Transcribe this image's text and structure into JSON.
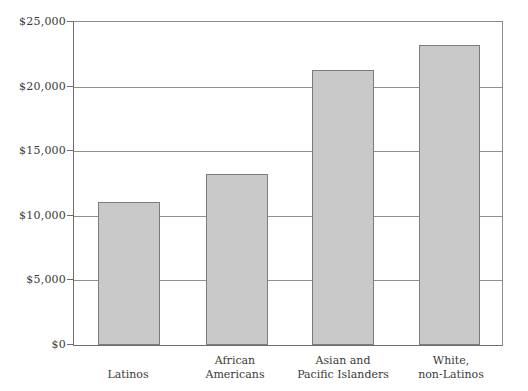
{
  "chart_data": {
    "type": "bar",
    "title": "",
    "subtitle": "",
    "xlabel": "",
    "ylabel": "",
    "categories": [
      "Latinos",
      "African Americans",
      "Asian and Pacific Islanders",
      "White, non-Latinos"
    ],
    "category_lines": [
      [
        "Latinos"
      ],
      [
        "African",
        "Americans"
      ],
      [
        "Asian and",
        "Pacific Islanders"
      ],
      [
        "White,",
        "non-Latinos"
      ]
    ],
    "values": [
      11100,
      13200,
      21300,
      23200
    ],
    "ylim": [
      0,
      25000
    ],
    "ytick_values": [
      0,
      5000,
      10000,
      15000,
      20000,
      25000
    ],
    "ytick_labels": [
      "$0",
      "$5,000",
      "$10,000",
      "$15,000",
      "$20,000",
      "$25,000"
    ],
    "grid": true,
    "legend": "none",
    "colors": {
      "bar_fill": "#c9c9c9",
      "bar_border": "#7d7d7d",
      "gridline": "#8f8f8f",
      "axis": "#6e6e6e",
      "text": "#3a3a3a",
      "background": "#ffffff"
    }
  }
}
